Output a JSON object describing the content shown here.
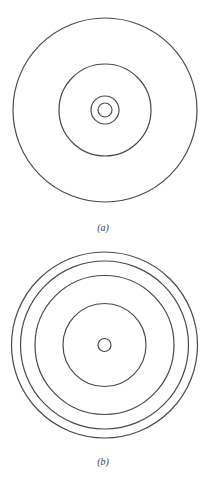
{
  "figure": {
    "panels": [
      {
        "id": "a",
        "label": "(a)",
        "center": [
          105,
          110
        ],
        "radii": [
          92,
          46,
          14,
          7
        ],
        "description": "Concentric circles: large outer, medium, and two small close inner circles"
      },
      {
        "id": "b",
        "label": "(b)",
        "center": [
          104.5,
          345
        ],
        "radii": [
          93,
          84,
          69.5,
          41.5,
          6.5
        ],
        "description": "Concentric circles: three closely spaced outer circles, one medium circle, one small center circle"
      }
    ],
    "stroke_color": "#4a4a4a",
    "background": "#ffffff"
  }
}
